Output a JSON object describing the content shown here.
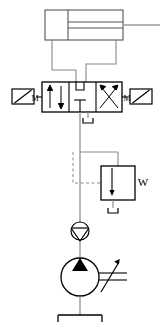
{
  "diagram": {
    "standard": "ISO 1219 fluid power symbols",
    "line_color": "#555555",
    "accent_color": "#000000",
    "background": "#ffffff"
  },
  "components": {
    "cylinder": {
      "name": "double-acting-cylinder",
      "type": "double-acting cylinder with single rod",
      "rod_side": "right",
      "ports": 2
    },
    "directional_valve": {
      "name": "directional-control-valve",
      "type": "4/3-way directional control valve",
      "positions": 3,
      "ports": 4,
      "left_actuator_label": "M",
      "right_actuator_label": "M",
      "actuator_type": "solenoid",
      "left_position_symbol": "parallel-arrows",
      "center_position_symbol": "closed-center",
      "right_position_symbol": "crossed-arrows"
    },
    "relief_valve": {
      "name": "pressure-relief-valve",
      "type": "pressure relief valve, pilot operated",
      "spring_label": "W",
      "pilot_line": "dashed"
    },
    "check_valve": {
      "name": "check-valve",
      "type": "non-return / check valve"
    },
    "pump": {
      "name": "hydraulic-pump",
      "type": "variable displacement hydraulic pump",
      "adjustable": true,
      "flow_direction": "up"
    },
    "tank": {
      "name": "reservoir-tank",
      "type": "reservoir / tank",
      "count": 3
    }
  },
  "labels": {
    "solenoid_left": "M",
    "solenoid_right": "M",
    "relief_spring": "W"
  }
}
